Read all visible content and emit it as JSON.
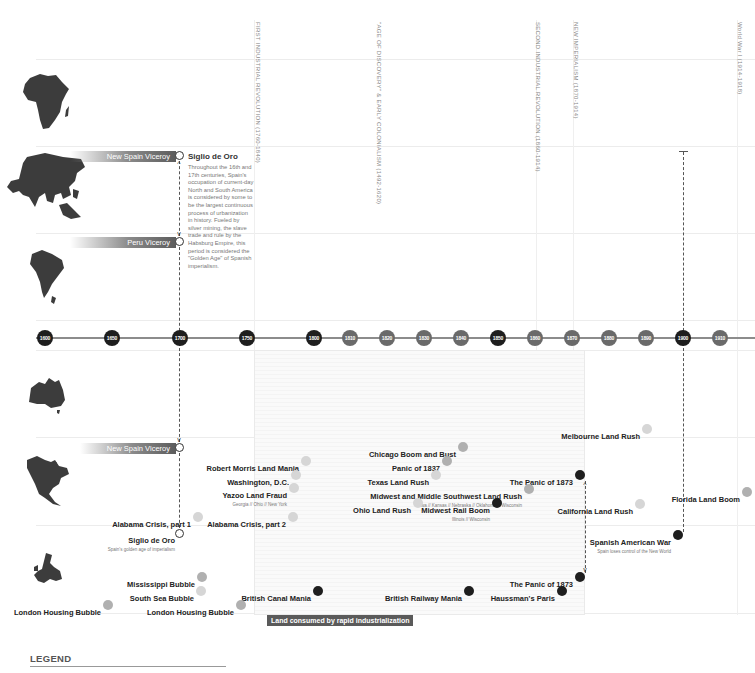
{
  "eras": [
    {
      "label": "FIRST INDUSTRIAL REVOLUTION (1760-1840)",
      "x": 257
    },
    {
      "label": "\"AGE OF DISCOVERY\" & EARLY COLONIALISM (1492-1620)",
      "x": 378
    },
    {
      "label": "SECOND INDUSTRIAL REVOLUTION (1860-1914)",
      "x": 537
    },
    {
      "label": "NEW IMPERIALISM (1870-1914)",
      "x": 575
    },
    {
      "label": "World War I (1914-1918)",
      "x": 739
    }
  ],
  "continents": [
    {
      "name": "africa",
      "label": "Africa"
    },
    {
      "name": "asia",
      "label": "Asia"
    },
    {
      "name": "south-america",
      "label": "South America"
    },
    {
      "name": "australia",
      "label": "Australia"
    },
    {
      "name": "north-america",
      "label": "North America"
    },
    {
      "name": "europe",
      "label": "Europe"
    }
  ],
  "bands": {
    "asia": "New Spain Viceroy",
    "south_america": "Peru Viceroy",
    "north_america": "New Spain Viceroy"
  },
  "siglio": {
    "title": "Siglio de Oro",
    "body": "Throughout the 16th and 17th centuries, Spain's occupation of current-day North and South America is considered by some to be the largest continuous process of urbanization in history. Fueled by silver mining, the slave trade and rule by the Habsburg Empire, this period is considered the \"Golden Age\" of Spanish imperialism.",
    "na_title": "Siglio de Oro",
    "na_sub": "Spain's golden age of imperialism"
  },
  "timeline": {
    "ticks": [
      {
        "label": "1600",
        "x": 45,
        "tone": "dark"
      },
      {
        "label": "1650",
        "x": 112,
        "tone": "dark"
      },
      {
        "label": "1700",
        "x": 180,
        "tone": "dark"
      },
      {
        "label": "1750",
        "x": 247,
        "tone": "dark"
      },
      {
        "label": "1800",
        "x": 314,
        "tone": "dark"
      },
      {
        "label": "1810",
        "x": 350,
        "tone": "mid"
      },
      {
        "label": "1820",
        "x": 387,
        "tone": "mid"
      },
      {
        "label": "1830",
        "x": 424,
        "tone": "mid"
      },
      {
        "label": "1840",
        "x": 461,
        "tone": "mid"
      },
      {
        "label": "1850",
        "x": 498,
        "tone": "dark"
      },
      {
        "label": "1860",
        "x": 535,
        "tone": "mid"
      },
      {
        "label": "1870",
        "x": 572,
        "tone": "mid"
      },
      {
        "label": "1880",
        "x": 609,
        "tone": "mid"
      },
      {
        "label": "1890",
        "x": 646,
        "tone": "mid"
      },
      {
        "label": "1900",
        "x": 683,
        "tone": "dark"
      },
      {
        "label": "1910",
        "x": 720,
        "tone": "mid"
      }
    ]
  },
  "events": [
    {
      "title": "Melbourne Land Rush",
      "sub": "",
      "right": 652,
      "top": 425,
      "dot": "light"
    },
    {
      "title": "Chicago Boom and Bust",
      "sub": "",
      "right": 468,
      "top": 443,
      "dot": "grey"
    },
    {
      "title": "Robert Morris Land Mania",
      "sub": "",
      "right": 311,
      "top": 457,
      "dot": "light"
    },
    {
      "title": "Panic of 1837",
      "sub": "",
      "right": 452,
      "top": 457,
      "dot": "grey"
    },
    {
      "title": "Washington, D.C.",
      "sub": "",
      "right": 301,
      "top": 471,
      "dot": "light"
    },
    {
      "title": "Texas Land Rush",
      "sub": "",
      "right": 441,
      "top": 471,
      "dot": "light"
    },
    {
      "title": "The Panic of 1873",
      "sub": "",
      "right": 585,
      "top": 471,
      "dot": "black"
    },
    {
      "title": "Yazoo Land Fraud",
      "sub": "Georgia // Ohio // New York",
      "right": 299,
      "top": 484,
      "dot": "light"
    },
    {
      "title": "Midwest and Middle Southwest Land Rush",
      "sub": "Iowa // Kansas // Nebraska // Oklahoma // Wisconsin",
      "right": 534,
      "top": 485,
      "dot": "grey"
    },
    {
      "title": "Florida Land Boom",
      "sub": "",
      "right": 752,
      "top": 488,
      "dot": "grey"
    },
    {
      "title": "Ohio Land Rush",
      "sub": "",
      "right": 423,
      "top": 499,
      "dot": "light"
    },
    {
      "title": "Midwest Rail Boom",
      "sub": "Illinois // Wisconsin",
      "right": 502,
      "top": 499,
      "dot": "black"
    },
    {
      "title": "California Land Rush",
      "sub": "",
      "right": 645,
      "top": 500,
      "dot": "light"
    },
    {
      "title": "Alabama Crisis, part 1",
      "sub": "",
      "right": 203,
      "top": 513,
      "dot": "light"
    },
    {
      "title": "Alabama Crisis, part 2",
      "sub": "",
      "right": 298,
      "top": 513,
      "dot": "light"
    },
    {
      "title": "Spanish American War",
      "sub": "Spain loses control of the New World",
      "right": 683,
      "top": 531,
      "dot": "black"
    },
    {
      "title": "Mississippi Bubble",
      "sub": "",
      "right": 207,
      "top": 573,
      "dot": "grey"
    },
    {
      "title": "The Panic of 1873",
      "sub": "",
      "right": 585,
      "top": 573,
      "dot": "black"
    },
    {
      "title": "South Sea Bubble",
      "sub": "",
      "right": 206,
      "top": 587,
      "dot": "light"
    },
    {
      "title": "British Canal Mania",
      "sub": "",
      "right": 323,
      "top": 587,
      "dot": "black"
    },
    {
      "title": "British Railway Mania",
      "sub": "",
      "right": 474,
      "top": 587,
      "dot": "black"
    },
    {
      "title": "Haussman's Paris",
      "sub": "",
      "right": 567,
      "top": 587,
      "dot": "black"
    },
    {
      "title": "London Housing Bubble",
      "sub": "",
      "right": 113,
      "top": 601,
      "dot": "grey"
    },
    {
      "title": "London Housing Bubble",
      "sub": "",
      "right": 246,
      "top": 601,
      "dot": "grey"
    }
  ],
  "shade": {
    "label": "Land consumed by rapid industrialization"
  },
  "legend": {
    "title": "LEGEND"
  },
  "colors": {
    "dark": "#1e1e1e",
    "mid": "#6a6a6a",
    "grey": "#b0b0b0",
    "light": "#d6d6d6"
  }
}
